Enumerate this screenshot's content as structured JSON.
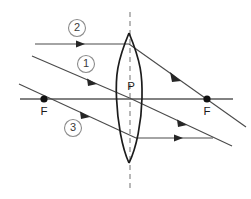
{
  "diagram": {
    "canvas": {
      "width": 251,
      "height": 199,
      "background": "#ffffff"
    },
    "colors": {
      "ray": "#4a4a4a",
      "axis": "#595959",
      "dashed_axis": "#9a9a9a",
      "lens_outline": "#1c1c1c",
      "focal_point": "#111111",
      "label_circle": "#8c8c8c",
      "label_text": "#3a3a3a"
    },
    "labels": {
      "ray_one": "1",
      "ray_two": "2",
      "ray_three": "3",
      "focal_left": "F",
      "focal_right": "F",
      "lens_center": "P"
    },
    "geometry": {
      "optical_axis": {
        "x1": 20,
        "y1": 99,
        "x2": 233,
        "y2": 99
      },
      "principal_axis_dashed": {
        "x": 130,
        "y1": 12,
        "y2": 190
      },
      "lens": {
        "top": {
          "x": 129,
          "y": 33
        },
        "bottom": {
          "x": 129,
          "y": 163
        },
        "max_half_width": 13,
        "center": {
          "x": 129.5,
          "y": 98
        }
      },
      "focal_left_point": {
        "x": 44,
        "y": 99
      },
      "focal_right_point": {
        "x": 207,
        "y": 99
      },
      "label_circles": [
        {
          "id": "2",
          "cx": 77,
          "cy": 28,
          "r": 8.5
        },
        {
          "id": "1",
          "cx": 86,
          "cy": 64,
          "r": 8.5
        },
        {
          "id": "3",
          "cx": 73,
          "cy": 128,
          "r": 8.5
        }
      ],
      "label_points": [
        {
          "id": "F-left",
          "x": 44,
          "y": 112
        },
        {
          "id": "F-right",
          "x": 207,
          "y": 112
        },
        {
          "id": "P",
          "x": 131,
          "y": 87
        }
      ],
      "rays": [
        {
          "id": "ray-2-incident",
          "desc": "Parallel incident ray 2 travelling toward lens top",
          "points": [
            [
              35,
              44
            ],
            [
              129,
              44
            ]
          ],
          "arrows": [
            {
              "x": 81,
              "y": 44,
              "angle": 0
            }
          ]
        },
        {
          "id": "ray-2-refracted",
          "desc": "Ray 2 refracted through right focal point F",
          "points": [
            [
              129,
              44
            ],
            [
              246,
              127
            ]
          ],
          "arrows": [
            {
              "x": 176,
              "y": 77,
              "angle": 35.4
            }
          ]
        },
        {
          "id": "ray-1-incident",
          "desc": "Ray 1 incident through optical centre P",
          "points": [
            [
              32,
              56
            ],
            [
              129.5,
              98
            ]
          ],
          "arrows": [
            {
              "x": 93,
              "y": 82,
              "angle": 23.3
            }
          ]
        },
        {
          "id": "ray-1-continued",
          "desc": "Ray 1 continues undeviated through optical centre",
          "points": [
            [
              129.5,
              98
            ],
            [
              232,
              146
            ]
          ],
          "arrows": [
            {
              "x": 183,
              "y": 123,
              "angle": 25.1
            }
          ]
        },
        {
          "id": "ray-3-incident",
          "desc": "Ray 3 incident through left focal point F",
          "points": [
            [
              19,
              84
            ],
            [
              136,
              138
            ]
          ],
          "arrows": [
            {
              "x": 86,
              "y": 115,
              "angle": 24.8
            }
          ]
        },
        {
          "id": "ray-3-refracted",
          "desc": "Ray 3 emerges parallel to optical axis",
          "points": [
            [
              136,
              138
            ],
            [
              213,
              138
            ]
          ],
          "arrows": [
            {
              "x": 179,
              "y": 138,
              "angle": 0
            }
          ]
        }
      ]
    }
  }
}
